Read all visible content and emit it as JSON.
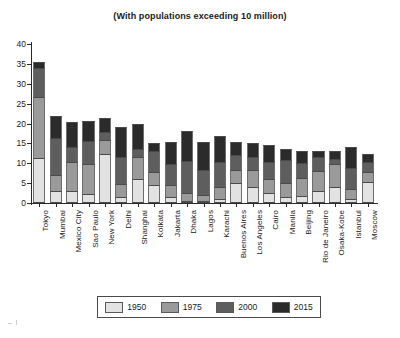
{
  "chart": {
    "title": "(With populations exceeding 10 million)",
    "ylabel": "",
    "xlabel": ""
  },
  "legend": {
    "position": "bottom-center",
    "items": [
      {
        "label": "1950",
        "color": "#e2e2e2"
      },
      {
        "label": "1975",
        "color": "#9a9a9a"
      },
      {
        "label": "2000",
        "color": "#5e5e5e"
      },
      {
        "label": "2015",
        "color": "#2b2b2b"
      }
    ]
  },
  "yaxis": {
    "ticks": [
      "0",
      "5",
      "10",
      "15",
      "20",
      "25",
      "30",
      "35",
      "40"
    ],
    "min": 0,
    "max": 40
  },
  "chart_data": {
    "type": "bar",
    "stacked": true,
    "title": "(With populations exceeding 10 million)",
    "xlabel": "",
    "ylabel": "",
    "ylim": [
      0,
      40
    ],
    "ytick_step": 5,
    "grid": false,
    "legend_position": "bottom-center",
    "units": "millions of people",
    "categories": [
      "Tokyo",
      "Mumbai",
      "Mexico City",
      "Sao Paulo",
      "New York",
      "Delhi",
      "Shanghai",
      "Kolkata",
      "Jakarta",
      "Dhaka",
      "Lagos",
      "Karachi",
      "Buenos Aires",
      "Los Angeles",
      "Cairo",
      "Manila",
      "Beijing",
      "Rio de Janeiro",
      "Osaka-Kobe",
      "Istanbul",
      "Moscow"
    ],
    "series": [
      {
        "name": "1950",
        "color": "#e2e2e2",
        "values": [
          11.3,
          2.9,
          3.1,
          2.3,
          12.3,
          1.4,
          6.1,
          4.5,
          1.5,
          0.3,
          0.3,
          1.1,
          5.1,
          4.0,
          2.5,
          1.5,
          1.7,
          3.0,
          4.1,
          1.0,
          5.4
        ]
      },
      {
        "name": "1975",
        "color": "#9a9a9a",
        "values": [
          15.4,
          4.1,
          7.3,
          7.4,
          3.5,
          3.5,
          5.5,
          3.4,
          3.1,
          1.9,
          1.5,
          2.9,
          3.1,
          4.4,
          3.5,
          3.5,
          4.5,
          5.0,
          5.6,
          2.6,
          2.4
        ]
      },
      {
        "name": "2000",
        "color": "#5e5e5e",
        "values": [
          7.2,
          9.3,
          3.8,
          6.0,
          2.1,
          6.6,
          2.1,
          5.3,
          5.3,
          8.1,
          6.4,
          6.3,
          3.8,
          3.3,
          4.3,
          5.8,
          3.8,
          3.5,
          1.5,
          5.2,
          2.4
        ]
      },
      {
        "name": "2015",
        "color": "#2b2b2b",
        "values": [
          1.6,
          5.6,
          6.2,
          5.0,
          3.6,
          7.6,
          6.1,
          1.9,
          5.5,
          7.7,
          6.9,
          6.5,
          3.3,
          3.3,
          4.3,
          2.8,
          3.0,
          1.5,
          2.0,
          5.3,
          2.2
        ]
      }
    ],
    "totals": [
      35.5,
      21.9,
      20.4,
      20.7,
      21.5,
      19.1,
      19.8,
      15.1,
      15.4,
      18.0,
      15.1,
      16.8,
      15.3,
      15.0,
      14.6,
      13.6,
      13.0,
      13.0,
      13.2,
      14.1,
      12.4
    ]
  }
}
